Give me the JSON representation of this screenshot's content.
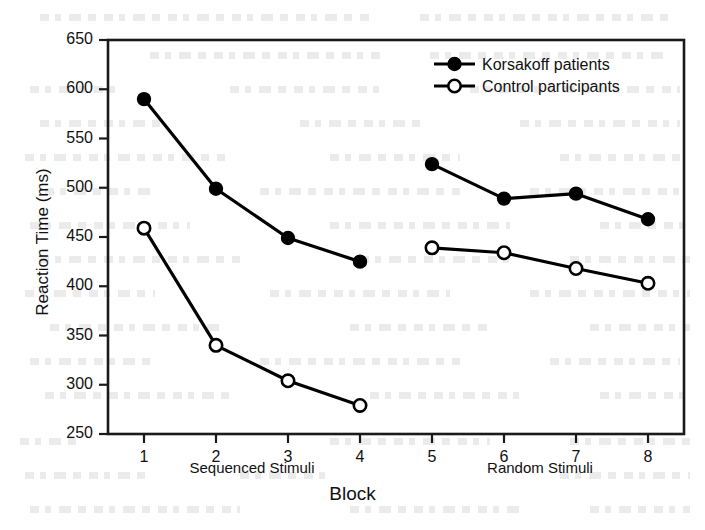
{
  "chart_data": {
    "type": "line",
    "title": "",
    "xlabel": "Block",
    "ylabel": "Reaction Time (ms)",
    "x": [
      1,
      2,
      3,
      4,
      5,
      6,
      7,
      8
    ],
    "categories": [
      "1",
      "2",
      "3",
      "4",
      "5",
      "6",
      "7",
      "8"
    ],
    "xlim": [
      0.5,
      8.5
    ],
    "ylim": [
      250,
      650
    ],
    "yticks": [
      250,
      300,
      350,
      400,
      450,
      500,
      550,
      600,
      650
    ],
    "ytick_labels": [
      "250",
      "300",
      "350",
      "400",
      "450",
      "500",
      "550",
      "600",
      "650"
    ],
    "xticks": [
      1,
      2,
      3,
      4,
      5,
      6,
      7,
      8
    ],
    "xtick_labels": [
      "1",
      "2",
      "3",
      "4",
      "5",
      "6",
      "7",
      "8"
    ],
    "grid": false,
    "legend_position": "top-right",
    "series": [
      {
        "name": "Korsakoff patients",
        "marker": "filled-circle",
        "color": "#000000",
        "values": [
          590,
          499,
          449,
          425,
          524,
          489,
          494,
          468
        ],
        "segments": [
          {
            "x": [
              1,
              2,
              3,
              4
            ],
            "values": [
              590,
              499,
              449,
              425
            ]
          },
          {
            "x": [
              5,
              6,
              7,
              8
            ],
            "values": [
              524,
              489,
              494,
              468
            ]
          }
        ]
      },
      {
        "name": "Control participants",
        "marker": "open-circle",
        "color": "#000000",
        "values": [
          459,
          340,
          304,
          279,
          439,
          434,
          418,
          403
        ],
        "segments": [
          {
            "x": [
              1,
              2,
              3,
              4
            ],
            "values": [
              459,
              340,
              304,
              279
            ]
          },
          {
            "x": [
              5,
              6,
              7,
              8
            ],
            "values": [
              439,
              434,
              418,
              403
            ]
          }
        ]
      }
    ],
    "annotations": [
      {
        "text": "Sequenced Stimuli",
        "x_span": [
          1,
          4
        ],
        "position": "below-axis"
      },
      {
        "text": "Random Stimuli",
        "x_span": [
          5,
          8
        ],
        "position": "below-axis"
      }
    ]
  },
  "legend": {
    "items": [
      {
        "label": "Korsakoff patients",
        "marker": "filled-circle"
      },
      {
        "label": "Control participants",
        "marker": "open-circle"
      }
    ]
  },
  "axis_colors": {
    "frame": "#1a1a1a",
    "series": "#000000"
  }
}
